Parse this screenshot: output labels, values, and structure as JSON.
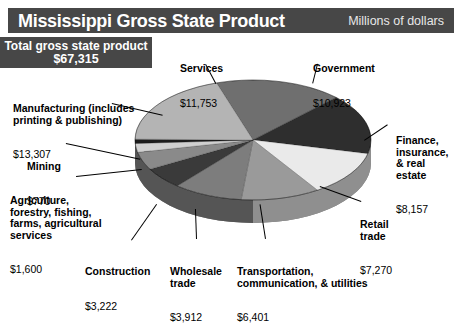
{
  "header": {
    "title": "Mississippi Gross State Product",
    "units": "Millions of dollars",
    "bar_color": "#474747"
  },
  "total": {
    "label": "Total gross state product",
    "value": "$67,315",
    "box_color": "#474747"
  },
  "labels": {
    "services": {
      "name": "Services",
      "value": "$11,753"
    },
    "government": {
      "name": "Government",
      "value": "$10,923"
    },
    "manufacturing": {
      "name": "Manufacturing (includes\nprinting & publishing)",
      "value": "$13,307"
    },
    "mining": {
      "name": "Mining",
      "value": "$770"
    },
    "agriculture": {
      "name": "Agriculture,\nforestry, fishing,\nfarms, agricultural\nservices",
      "value": "$1,600"
    },
    "construction": {
      "name": "Construction",
      "value": "$3,222"
    },
    "wholesale": {
      "name": "Wholesale\ntrade",
      "value": "$3,912"
    },
    "transportation": {
      "name": "Transportation,\ncommunication, & utilities",
      "value": "$6,401"
    },
    "retail": {
      "name": "Retail\ntrade",
      "value": "$7,270"
    },
    "finance": {
      "name": "Finance,\ninsurance,\n& real\nestate",
      "value": "$8,157"
    }
  },
  "chart_data": {
    "type": "pie",
    "title": "Mississippi Gross State Product",
    "subtitle": "Millions of dollars",
    "total": 67315,
    "unit": "Millions of dollars",
    "three_d": true,
    "legend": "callout-labels",
    "categories": [
      "Services",
      "Government",
      "Finance, insurance, & real estate",
      "Retail trade",
      "Transportation, communication, & utilities",
      "Wholesale trade",
      "Construction",
      "Agriculture, forestry, fishing, farms, agricultural services",
      "Mining",
      "Manufacturing (includes printing & publishing)"
    ],
    "values": [
      11753,
      10923,
      8157,
      7270,
      6401,
      3912,
      3222,
      1600,
      770,
      13307
    ],
    "percentages": [
      17.5,
      16.2,
      12.1,
      10.8,
      9.5,
      5.8,
      4.8,
      2.4,
      1.1,
      19.8
    ],
    "colors": [
      "#6f6f6f",
      "#2e2e2e",
      "#eaeaea",
      "#9a9a9a",
      "#7d7d7d",
      "#3a3a3a",
      "#8a8a8a",
      "#d0d0d0",
      "#1c1c1c",
      "#b4b4b4"
    ]
  }
}
